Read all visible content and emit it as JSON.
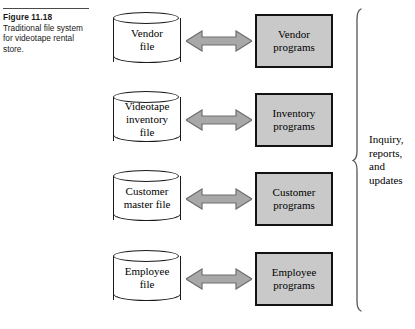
{
  "figure": {
    "number": "Figure 11.18",
    "caption_lines": [
      "Traditional file system",
      "for videotape rental",
      "store."
    ]
  },
  "colors": {
    "box_fill": "#c9c9c9",
    "box_border": "#131313",
    "arrow_fill": "#a8a8a8",
    "arrow_stroke": "#6e6e6e",
    "line": "#1a1a1a",
    "background": "#ffffff"
  },
  "diagram": {
    "type": "flow",
    "rows": [
      {
        "file_lines": [
          "Vendor",
          "file"
        ],
        "program_lines": [
          "Vendor",
          "programs"
        ],
        "arrow": "double-headed"
      },
      {
        "file_lines": [
          "Videotape",
          "inventory",
          "file"
        ],
        "program_lines": [
          "Inventory",
          "programs"
        ],
        "arrow": "double-headed"
      },
      {
        "file_lines": [
          "Customer",
          "master file"
        ],
        "program_lines": [
          "Customer",
          "programs"
        ],
        "arrow": "double-headed"
      },
      {
        "file_lines": [
          "Employee",
          "file"
        ],
        "program_lines": [
          "Employee",
          "programs"
        ],
        "arrow": "double-headed"
      }
    ],
    "output_label_lines": [
      "Inquiry,",
      "reports,",
      "and",
      "updates"
    ]
  }
}
